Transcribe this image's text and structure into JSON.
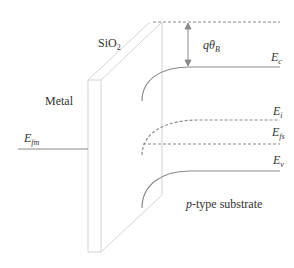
{
  "diagram": {
    "type": "MOS energy band diagram",
    "labels": {
      "oxide": "SiO",
      "oxide_sub": "2",
      "metal": "Metal",
      "efm": "E",
      "efm_sub": "fm",
      "qtheta": "qθ",
      "qtheta_sub": "B",
      "ec": "E",
      "ec_sub": "c",
      "ei": "E",
      "ei_sub": "i",
      "efs": "E",
      "efs_sub": "fs",
      "ev": "E",
      "ev_sub": "v",
      "substrate_italic": "p",
      "substrate": "-type substrate"
    },
    "colors": {
      "line": "#8a8a8a",
      "slab": "#d4d4d4",
      "text": "#333333"
    }
  }
}
